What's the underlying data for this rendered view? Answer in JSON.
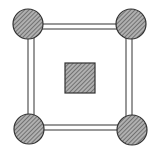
{
  "diagram": {
    "colors": {
      "background": "#ffffff",
      "stroke": "#333333",
      "hatch_fill": "#9a9a9a",
      "hatch_line": "#555555"
    },
    "nodes": [
      {
        "id": "top-left",
        "cx": 28,
        "cy": 24,
        "r": 15
      },
      {
        "id": "top-right",
        "cx": 131,
        "cy": 24,
        "r": 15
      },
      {
        "id": "bottom-left",
        "cx": 29,
        "cy": 129,
        "r": 15
      },
      {
        "id": "bottom-right",
        "cx": 132,
        "cy": 130,
        "r": 15
      }
    ],
    "center_square": {
      "x": 65,
      "y": 63,
      "width": 30,
      "height": 30
    }
  }
}
